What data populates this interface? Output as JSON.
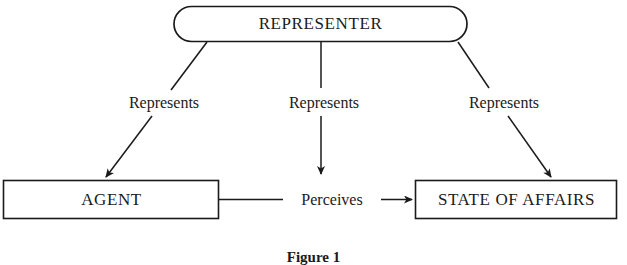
{
  "figure": {
    "caption": "Figure 1",
    "background_color": "#ffffff",
    "stroke_color": "#1a1a1a"
  },
  "nodes": {
    "representer": {
      "label": "REPRESENTER",
      "shape": "rounded-rectangle"
    },
    "agent": {
      "label": "AGENT",
      "shape": "rectangle"
    },
    "state_of_affairs": {
      "label": "STATE OF AFFAIRS",
      "shape": "rectangle"
    }
  },
  "edges": [
    {
      "id": "represents-left",
      "label": "Represents",
      "from": "representer",
      "to": "agent",
      "arrow": "to"
    },
    {
      "id": "represents-middle",
      "label": "Represents",
      "from": "representer",
      "to": "perceives",
      "arrow": "to"
    },
    {
      "id": "represents-right",
      "label": "Represents",
      "from": "representer",
      "to": "state_of_affairs",
      "arrow": "to"
    },
    {
      "id": "perceives",
      "label": "Perceives",
      "from": "agent",
      "to": "state_of_affairs",
      "arrow": "to"
    }
  ]
}
